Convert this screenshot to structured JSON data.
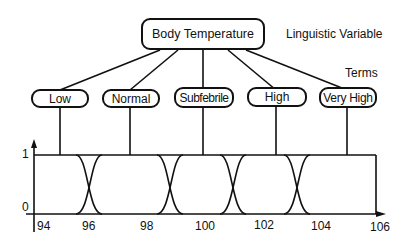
{
  "diagram": {
    "root": {
      "label": "Body Temperature"
    },
    "annotations": {
      "variable_label": "Linguistic Variable",
      "terms_label": "Terms"
    },
    "terms": [
      {
        "label": "Low"
      },
      {
        "label": "Normal"
      },
      {
        "label": "Subfebrile"
      },
      {
        "label": "High"
      },
      {
        "label": "Very High"
      }
    ],
    "membership_plot": {
      "y_ticks": [
        "1",
        "0"
      ],
      "x_ticks": [
        "94",
        "96",
        "98",
        "100",
        "102",
        "104",
        "106"
      ],
      "crossover_points": [
        95.3,
        98.8,
        100.9,
        103.2
      ]
    }
  }
}
